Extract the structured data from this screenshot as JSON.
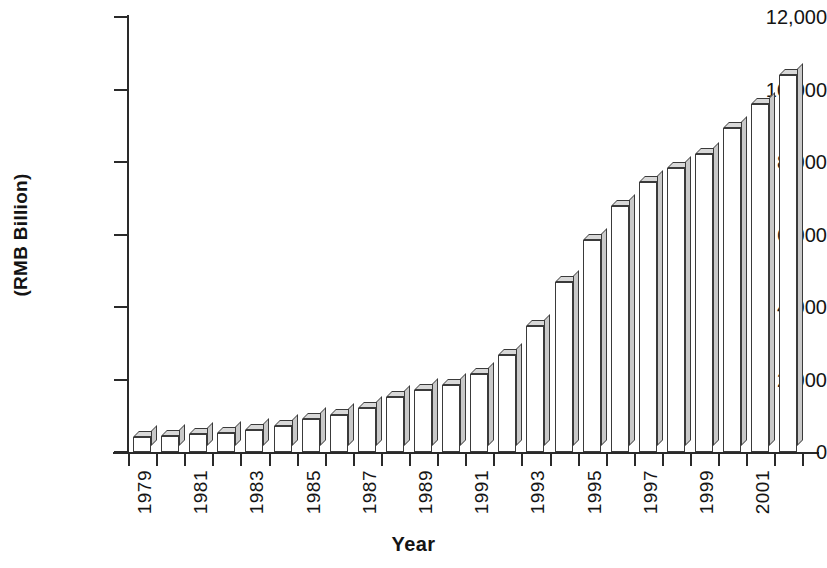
{
  "chart_data": {
    "type": "bar",
    "title": "",
    "xlabel": "Year",
    "ylabel": "(RMB Billion)",
    "ylim": [
      0,
      12000
    ],
    "ytick_values": [
      0,
      2000,
      4000,
      6000,
      8000,
      10000,
      12000
    ],
    "ytick_labels": [
      "0",
      "2,000",
      "4,000",
      "6,000",
      "8,000",
      "10,000",
      "12,000"
    ],
    "grid": false,
    "legend": null,
    "categories": [
      "1979",
      "1980",
      "1981",
      "1982",
      "1983",
      "1984",
      "1985",
      "1986",
      "1987",
      "1988",
      "1989",
      "1990",
      "1991",
      "1992",
      "1993",
      "1994",
      "1995",
      "1996",
      "1997",
      "1998",
      "1999",
      "2000",
      "2001",
      "2002"
    ],
    "xtick_labels_shown": [
      "1979",
      "1981",
      "1983",
      "1985",
      "1987",
      "1989",
      "1991",
      "1993",
      "1995",
      "1997",
      "1999",
      "2001"
    ],
    "values": [
      406,
      452,
      487,
      530,
      596,
      720,
      899,
      1027,
      1205,
      1504,
      1699,
      1847,
      2161,
      2663,
      3464,
      4676,
      5848,
      6789,
      7446,
      7835,
      8207,
      8946,
      9593,
      10398
    ]
  }
}
